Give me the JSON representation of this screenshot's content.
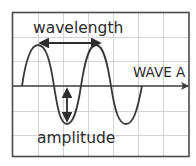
{
  "diagram": {
    "type": "sine-wave-diagram",
    "labels": {
      "wavelength": "wavelength",
      "amplitude": "amplitude",
      "wave_name": "WAVE A"
    },
    "colors": {
      "background": "#ffffff",
      "frame": "#4a4a4a",
      "grid": "#cfcfcf",
      "wave": "#3a3a3a",
      "axis": "#3a3a3a",
      "arrows": "#2e2e2e",
      "text": "#2a2a2a"
    },
    "grid": {
      "columns": 7,
      "rows": 6
    },
    "annotations": [
      {
        "name": "wavelength",
        "kind": "double-arrow",
        "orientation": "horizontal",
        "description": "peak to peak"
      },
      {
        "name": "amplitude",
        "kind": "double-arrow",
        "orientation": "vertical",
        "description": "axis to trough"
      }
    ],
    "wave": {
      "cycles_shown": 2,
      "starts_at": "axis",
      "direction_arrow": "right"
    }
  }
}
